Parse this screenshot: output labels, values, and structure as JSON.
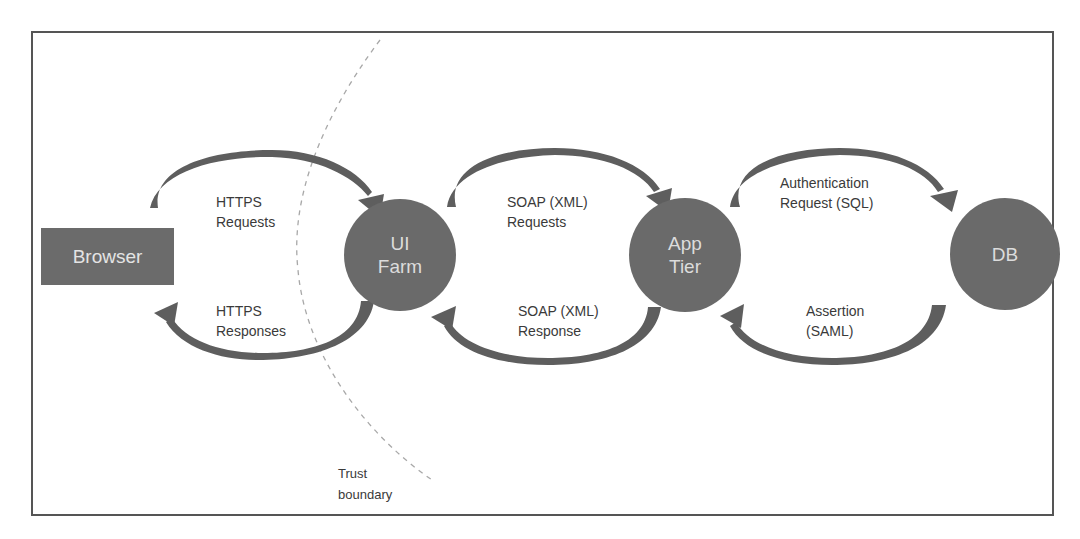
{
  "diagram": {
    "colors": {
      "frame_border": "#555555",
      "node_fill": "#6a6a6a",
      "node_text": "#dcdcdc",
      "arrow": "#5e5e5e",
      "boundary": "#a0a0a0",
      "label_text": "#3a3a3a"
    },
    "nodes": {
      "browser": {
        "label": "Browser"
      },
      "ui_farm": {
        "line1": "UI",
        "line2": "Farm"
      },
      "app_tier": {
        "line1": "App",
        "line2": "Tier"
      },
      "db": {
        "label": "DB"
      }
    },
    "edges": {
      "https_requests": {
        "line1": "HTTPS",
        "line2": "Requests"
      },
      "https_responses": {
        "line1": "HTTPS",
        "line2": "Responses"
      },
      "soap_requests": {
        "line1": "SOAP (XML)",
        "line2": "Requests"
      },
      "soap_response": {
        "line1": "SOAP (XML)",
        "line2": "Response"
      },
      "auth_request": {
        "line1": "Authentication",
        "line2": "Request (SQL)"
      },
      "assertion": {
        "line1": "Assertion",
        "line2": "(SAML)"
      }
    },
    "trust_boundary": {
      "line1": "Trust",
      "line2": "boundary"
    }
  }
}
